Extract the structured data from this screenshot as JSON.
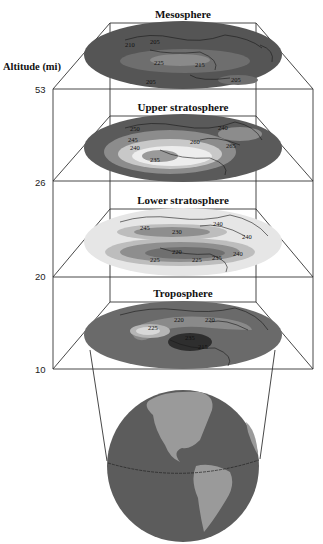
{
  "axis": {
    "title": "Altitude (mi)",
    "ticks": [
      "53",
      "26",
      "20",
      "10"
    ]
  },
  "layers": [
    {
      "name": "Mesosphere",
      "contour_labels": [
        "210",
        "205",
        "225",
        "215",
        "205",
        "205"
      ],
      "base_color": "#555555",
      "band_colors": [
        "#6e6e6e",
        "#8a8a8a"
      ]
    },
    {
      "name": "Upper stratosphere",
      "contour_labels": [
        "250",
        "245",
        "240",
        "235",
        "260",
        "240",
        "265"
      ],
      "base_color": "#5a5a5a",
      "band_colors": [
        "#8c8c8c",
        "#c8c8c8",
        "#ededed",
        "#9a9a9a"
      ]
    },
    {
      "name": "Lower stratosphere",
      "contour_labels": [
        "240",
        "245",
        "230",
        "240",
        "225",
        "220",
        "225",
        "235",
        "240"
      ],
      "base_color": "#e6e6e6",
      "band_colors": [
        "#bdbdbd",
        "#8e8e8e",
        "#6f6f6f"
      ]
    },
    {
      "name": "Troposphere",
      "contour_labels": [
        "220",
        "225",
        "220",
        "235",
        "215"
      ],
      "base_color": "#6a6a6a",
      "band_colors": [
        "#8a8a8a",
        "#b5b5b5",
        "#d8d8d8",
        "#2e2e2e"
      ]
    }
  ],
  "globe": {
    "ocean_color": "#5c5c5c",
    "land_color": "#9a9a9a"
  }
}
